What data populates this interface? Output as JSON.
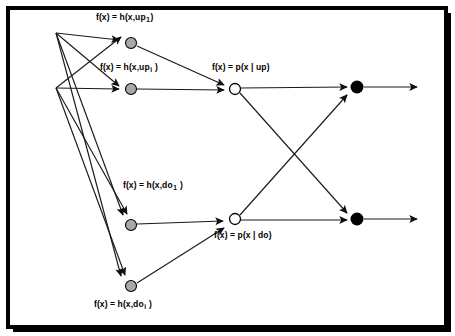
{
  "figure": {
    "frame": {
      "border_color": "#000000",
      "background_color": "#ffffff",
      "shadow_color": "#000000"
    },
    "colors": {
      "line": "#1a1a1a",
      "hidden_node_fill": "#a8a8a8",
      "hidden_node_stroke": "#000000",
      "gate_node_fill": "#ffffff",
      "gate_node_stroke": "#000000",
      "output_node_fill": "#000000",
      "text": "#000000"
    },
    "labels": {
      "up_first": {
        "prefix": "f(x) = h(x,up",
        "sub": "1",
        "suffix": ")"
      },
      "up_i": {
        "prefix": "f(x) = h(x,up",
        "sub": "i",
        "suffix": " )"
      },
      "p_up": {
        "prefix": "f(x) = p(x | up)",
        "sub": "",
        "suffix": ""
      },
      "do_first": {
        "prefix": "f(x) = h(x,do",
        "sub": "1",
        "suffix": " )"
      },
      "do_i": {
        "prefix": "f(x) = h(x,do",
        "sub": "i",
        "suffix": " )"
      },
      "p_do": {
        "prefix": "f(x) = p(x | do)",
        "sub": "",
        "suffix": ""
      }
    },
    "nodes": [
      {
        "id": "src-top",
        "name": "input-fanout-top",
        "x": 56,
        "y": 33,
        "r": 0,
        "type": "junction"
      },
      {
        "id": "src-bot",
        "name": "input-fanout-bottom",
        "x": 56,
        "y": 88,
        "r": 0,
        "type": "junction"
      },
      {
        "id": "up1",
        "name": "expert-node-up-1",
        "x": 131,
        "y": 43,
        "r": 5.5,
        "type": "hidden"
      },
      {
        "id": "upi",
        "name": "expert-node-up-i",
        "x": 131,
        "y": 89,
        "r": 5.5,
        "type": "hidden"
      },
      {
        "id": "do1",
        "name": "expert-node-do-1",
        "x": 131,
        "y": 225,
        "r": 5.5,
        "type": "hidden"
      },
      {
        "id": "doi",
        "name": "expert-node-do-i",
        "x": 131,
        "y": 286,
        "r": 5.5,
        "type": "hidden"
      },
      {
        "id": "gup",
        "name": "gate-node-up",
        "x": 235,
        "y": 89,
        "r": 5.5,
        "type": "gate"
      },
      {
        "id": "gdo",
        "name": "gate-node-do",
        "x": 235,
        "y": 219,
        "r": 5.5,
        "type": "gate"
      },
      {
        "id": "outup",
        "name": "output-node-up",
        "x": 357,
        "y": 87,
        "r": 6.5,
        "type": "output"
      },
      {
        "id": "outdo",
        "name": "output-node-do",
        "x": 357,
        "y": 219,
        "r": 6.5,
        "type": "output"
      }
    ],
    "edges": [
      {
        "name": "edge-input-top-to-up-1",
        "from": "src-top",
        "to": "up1",
        "arrow": true
      },
      {
        "name": "edge-input-top-to-up-i",
        "from": "src-top",
        "to": "upi",
        "arrow": true
      },
      {
        "name": "edge-input-top-to-do-1",
        "from": "src-top",
        "to": "do1",
        "arrow": true
      },
      {
        "name": "edge-input-top-to-do-i",
        "from": "src-top",
        "to": "doi",
        "arrow": true
      },
      {
        "name": "edge-input-bottom-to-up-1",
        "from": "src-bot",
        "to": "up1",
        "arrow": true
      },
      {
        "name": "edge-input-bottom-to-up-i",
        "from": "src-bot",
        "to": "upi",
        "arrow": true
      },
      {
        "name": "edge-input-bottom-to-do-1",
        "from": "src-bot",
        "to": "do1",
        "arrow": true
      },
      {
        "name": "edge-input-bottom-to-do-i",
        "from": "src-bot",
        "to": "doi",
        "arrow": true
      },
      {
        "name": "edge-up-1-to-gate-up",
        "from": "up1",
        "to": "gup",
        "arrow": true
      },
      {
        "name": "edge-up-i-to-gate-up",
        "from": "upi",
        "to": "gup",
        "arrow": true
      },
      {
        "name": "edge-do-1-to-gate-do",
        "from": "do1",
        "to": "gdo",
        "arrow": true
      },
      {
        "name": "edge-do-i-to-gate-do",
        "from": "doi",
        "to": "gdo",
        "arrow": true
      },
      {
        "name": "edge-gate-up-to-output-up",
        "from": "gup",
        "to": "outup",
        "arrow": true
      },
      {
        "name": "edge-gate-up-to-output-do",
        "from": "gup",
        "to": "outdo",
        "arrow": true
      },
      {
        "name": "edge-gate-do-to-output-up",
        "from": "gdo",
        "to": "outup",
        "arrow": true
      },
      {
        "name": "edge-gate-do-to-output-do",
        "from": "gdo",
        "to": "outdo",
        "arrow": true
      },
      {
        "name": "edge-output-up-exit",
        "from": "outup",
        "to": "exit-up",
        "arrow": true
      },
      {
        "name": "edge-output-do-exit",
        "from": "outdo",
        "to": "exit-do",
        "arrow": true
      }
    ]
  }
}
